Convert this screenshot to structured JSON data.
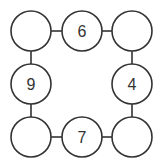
{
  "diagram": {
    "type": "number-circle-puzzle",
    "nodes": [
      {
        "id": "top-left",
        "label": "",
        "cx": 31,
        "cy": 31
      },
      {
        "id": "top-middle",
        "label": "6",
        "cx": 82,
        "cy": 31
      },
      {
        "id": "top-right",
        "label": "",
        "cx": 132,
        "cy": 31
      },
      {
        "id": "middle-left",
        "label": "9",
        "cx": 31,
        "cy": 84
      },
      {
        "id": "middle-right",
        "label": "4",
        "cx": 132,
        "cy": 84
      },
      {
        "id": "bottom-left",
        "label": "",
        "cx": 31,
        "cy": 137
      },
      {
        "id": "bottom-middle",
        "label": "7",
        "cx": 82,
        "cy": 137
      },
      {
        "id": "bottom-right",
        "label": "",
        "cx": 132,
        "cy": 137
      }
    ],
    "edges": [
      [
        "top-left",
        "top-middle"
      ],
      [
        "top-middle",
        "top-right"
      ],
      [
        "top-right",
        "middle-right"
      ],
      [
        "middle-right",
        "bottom-right"
      ],
      [
        "bottom-right",
        "bottom-middle"
      ],
      [
        "bottom-middle",
        "bottom-left"
      ],
      [
        "bottom-left",
        "middle-left"
      ],
      [
        "middle-left",
        "top-left"
      ]
    ],
    "radius": 20,
    "stroke_color": "#333333"
  }
}
